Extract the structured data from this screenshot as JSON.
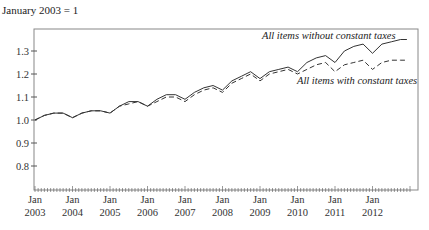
{
  "header": {
    "title": "January 2003 = 1"
  },
  "labels": {
    "series_a": "All items without constant taxes",
    "series_b": "All items with constant taxes"
  },
  "colors": {
    "line": "#333333",
    "frame": "#777777"
  },
  "chart_data": {
    "type": "line",
    "title": "January 2003 = 1",
    "xlabel": "",
    "ylabel": "",
    "ylim": [
      0.7,
      1.39
    ],
    "yticks": [
      0.8,
      0.9,
      1.0,
      1.1,
      1.2,
      1.3
    ],
    "ytick_labels": [
      "0.8",
      "0.9",
      "1.0",
      "1.1",
      "1.2",
      "1.3"
    ],
    "xtick_labels": [
      "Jan 2003",
      "Jan 2004",
      "Jan 2005",
      "Jan 2006",
      "Jan 2007",
      "Jan 2008",
      "Jan 2009",
      "Jan 2010",
      "Jan 2011",
      "Jan 2012"
    ],
    "grid": false,
    "x": [
      "2003-01",
      "2003-04",
      "2003-07",
      "2003-10",
      "2004-01",
      "2004-04",
      "2004-07",
      "2004-10",
      "2005-01",
      "2005-04",
      "2005-07",
      "2005-10",
      "2006-01",
      "2006-04",
      "2006-07",
      "2006-10",
      "2007-01",
      "2007-04",
      "2007-07",
      "2007-10",
      "2008-01",
      "2008-04",
      "2008-07",
      "2008-10",
      "2009-01",
      "2009-04",
      "2009-07",
      "2009-10",
      "2010-01",
      "2010-04",
      "2010-07",
      "2010-10",
      "2011-01",
      "2011-04",
      "2011-07",
      "2011-10",
      "2012-01",
      "2012-04",
      "2012-07",
      "2012-10",
      "2012-12"
    ],
    "series": [
      {
        "name": "All items without constant taxes",
        "style": "solid",
        "values": [
          1.0,
          1.02,
          1.03,
          1.03,
          1.01,
          1.03,
          1.04,
          1.04,
          1.03,
          1.06,
          1.08,
          1.08,
          1.06,
          1.09,
          1.11,
          1.11,
          1.09,
          1.12,
          1.14,
          1.15,
          1.13,
          1.17,
          1.19,
          1.21,
          1.18,
          1.21,
          1.22,
          1.23,
          1.21,
          1.25,
          1.27,
          1.28,
          1.25,
          1.3,
          1.32,
          1.33,
          1.29,
          1.33,
          1.34,
          1.35,
          1.35
        ]
      },
      {
        "name": "All items with constant taxes",
        "style": "dashed",
        "values": [
          1.0,
          1.02,
          1.03,
          1.03,
          1.01,
          1.03,
          1.04,
          1.04,
          1.03,
          1.06,
          1.07,
          1.08,
          1.06,
          1.08,
          1.1,
          1.1,
          1.08,
          1.11,
          1.13,
          1.14,
          1.12,
          1.16,
          1.18,
          1.2,
          1.17,
          1.2,
          1.21,
          1.22,
          1.2,
          1.22,
          1.24,
          1.25,
          1.21,
          1.24,
          1.25,
          1.26,
          1.22,
          1.25,
          1.26,
          1.26,
          1.26
        ]
      }
    ]
  }
}
